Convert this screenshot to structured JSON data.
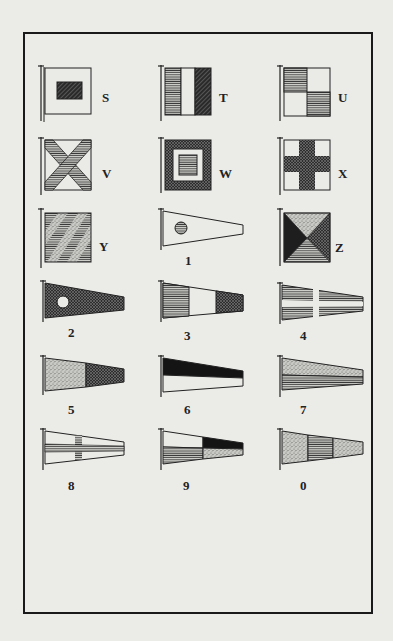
{
  "page": {
    "header_text": ""
  },
  "flags": [
    {
      "id": "S",
      "label": "S",
      "shape": "square",
      "design": "white field with small dark hatched rectangle in centre"
    },
    {
      "id": "T",
      "label": "T",
      "shape": "square",
      "design": "three vertical bands: horizontal-hatched, white, dark hatched"
    },
    {
      "id": "U",
      "label": "U",
      "shape": "square",
      "design": "quartered: hatched top-left and bottom-right, white others"
    },
    {
      "id": "V",
      "label": "V",
      "shape": "square",
      "design": "white field with hatched diagonal saltire cross"
    },
    {
      "id": "W",
      "label": "W",
      "shape": "square",
      "design": "dark border, white middle, hatched centre square"
    },
    {
      "id": "X",
      "label": "X",
      "shape": "square",
      "design": "white field with dark hatched upright cross"
    },
    {
      "id": "Y",
      "label": "Y",
      "shape": "square",
      "design": "diagonal stripes alternating stippled and hatched"
    },
    {
      "id": "Z",
      "label": "Z",
      "shape": "square",
      "design": "four triangles: stippled top, hatched right, horizontal-lined bottom, dark left"
    },
    {
      "id": "1",
      "label": "1",
      "shape": "pennant",
      "design": "white pennant with hatched disc"
    },
    {
      "id": "2",
      "label": "2",
      "shape": "pennant",
      "design": "dark hatched pennant with white disc"
    },
    {
      "id": "3",
      "label": "3",
      "shape": "pennant",
      "design": "three vertical bands: horizontal-lined, white, dark hatched"
    },
    {
      "id": "4",
      "label": "4",
      "shape": "pennant",
      "design": "horizontal-lined field with white cross"
    },
    {
      "id": "5",
      "label": "5",
      "shape": "pennant",
      "design": "stippled hoist, dark hatched fly"
    },
    {
      "id": "6",
      "label": "6",
      "shape": "pennant",
      "design": "dark top half, white bottom half"
    },
    {
      "id": "7",
      "label": "7",
      "shape": "pennant",
      "design": "stippled top half, horizontal-lined bottom half"
    },
    {
      "id": "8",
      "label": "8",
      "shape": "pennant",
      "design": "white field with horizontal-lined cross"
    },
    {
      "id": "9",
      "label": "9",
      "shape": "pennant",
      "design": "quartered: white, dark, lined, stippled"
    },
    {
      "id": "0",
      "label": "0",
      "shape": "pennant",
      "design": "stippled hoist and fly with lined centre band"
    }
  ]
}
